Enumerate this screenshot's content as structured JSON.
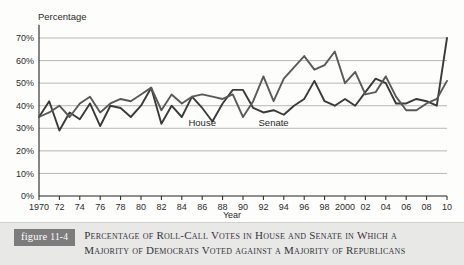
{
  "figure": {
    "tag_word": "figure",
    "tag_number": "11-4",
    "caption_line_1": "Percentage of Roll-Call Votes in House and Senate in Which a",
    "caption_line_2": "Majority of Democrats Voted against a Majority of Republicans"
  },
  "chart_data": {
    "type": "line",
    "title": "",
    "xlabel": "Year",
    "ylabel": "Percentage",
    "ylim": [
      0,
      75
    ],
    "xlim": [
      1970,
      2010
    ],
    "grid": true,
    "legend_position": "inline-labels",
    "ytick_labels": [
      "0%",
      "10%",
      "20%",
      "30%",
      "40%",
      "50%",
      "60%",
      "70%"
    ],
    "ytick_values": [
      0,
      10,
      20,
      30,
      40,
      50,
      60,
      70
    ],
    "xtick_labels": [
      "1970",
      "72",
      "74",
      "76",
      "78",
      "80",
      "82",
      "84",
      "86",
      "88",
      "90",
      "92",
      "94",
      "96",
      "98",
      "2000",
      "02",
      "04",
      "06",
      "08",
      "10"
    ],
    "xtick_values": [
      1970,
      1972,
      1974,
      1976,
      1978,
      1980,
      1982,
      1984,
      1986,
      1988,
      1990,
      1992,
      1994,
      1996,
      1998,
      2000,
      2002,
      2004,
      2006,
      2008,
      2010
    ],
    "x": [
      1970,
      1971,
      1972,
      1973,
      1974,
      1975,
      1976,
      1977,
      1978,
      1979,
      1980,
      1981,
      1982,
      1983,
      1984,
      1985,
      1986,
      1987,
      1988,
      1989,
      1990,
      1991,
      1992,
      1993,
      1994,
      1995,
      1996,
      1997,
      1998,
      1999,
      2000,
      2001,
      2002,
      2003,
      2004,
      2005,
      2006,
      2007,
      2008,
      2009,
      2010
    ],
    "series": [
      {
        "name": "House",
        "label": "House",
        "color": "#3a3a3a",
        "values": [
          35,
          42,
          29,
          37,
          34,
          41,
          31,
          40,
          39,
          35,
          40,
          48,
          32,
          40,
          35,
          44,
          39,
          33,
          41,
          47,
          47,
          39,
          37,
          38,
          36,
          40,
          43,
          51,
          42,
          40,
          43,
          40,
          46,
          52,
          50,
          41,
          41,
          43,
          42,
          40,
          70
        ]
      },
      {
        "name": "Senate",
        "label": "Senate",
        "color": "#595959",
        "values": [
          35,
          37,
          40,
          35,
          41,
          44,
          37,
          41,
          43,
          42,
          45,
          48,
          38,
          45,
          41,
          44,
          45,
          44,
          43,
          45,
          35,
          42,
          53,
          42,
          52,
          57,
          62,
          56,
          58,
          64,
          50,
          55,
          45,
          46,
          53,
          44,
          38,
          38,
          41,
          43,
          51
        ]
      }
    ],
    "series_annotations": [
      {
        "text": "House",
        "x": 1986,
        "y": 31
      },
      {
        "text": "Senate",
        "x": 1993,
        "y": 31
      }
    ]
  }
}
